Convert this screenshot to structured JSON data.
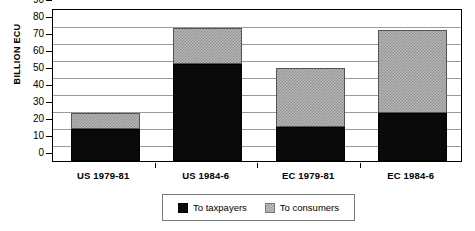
{
  "chart_data": {
    "type": "bar",
    "stacked": true,
    "title": "",
    "xlabel": "",
    "ylabel": "BILLION ECU",
    "ylim": [
      0,
      90
    ],
    "ytick_step": 10,
    "yticks": [
      90,
      80,
      70,
      60,
      50,
      40,
      30,
      20,
      10,
      0
    ],
    "grid": true,
    "legend_position": "bottom",
    "categories": [
      "US 1979-81",
      "US 1984-6",
      "EC 1979-81",
      "EC 1984-6"
    ],
    "series": [
      {
        "name": "To taxpayers",
        "color": "#0a0a0a",
        "values": [
          19,
          57,
          20,
          28
        ]
      },
      {
        "name": "To consumers",
        "color": "#b6b6b6",
        "values": [
          9,
          21,
          35,
          49
        ]
      }
    ],
    "totals": [
      28,
      78,
      55,
      77
    ]
  },
  "axis": {
    "y_title": "BILLION ECU"
  },
  "legend": {
    "entries": [
      {
        "label": "To taxpayers",
        "swatch": "black-square"
      },
      {
        "label": "To consumers",
        "swatch": "gray-hatched-square"
      }
    ]
  }
}
